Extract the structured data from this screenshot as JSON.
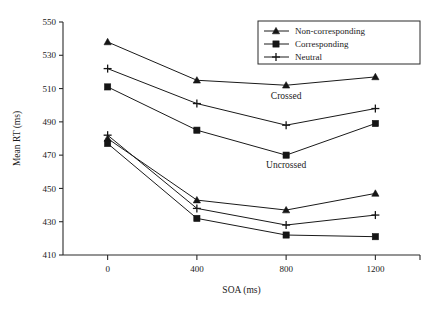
{
  "chart_data": {
    "type": "line",
    "title": "",
    "xlabel": "SOA (ms)",
    "ylabel": "Mean RT (ms)",
    "categories": [
      "0",
      "400",
      "800",
      "1200"
    ],
    "x": [
      0,
      400,
      800,
      1200
    ],
    "xlim": [
      -200,
      1400
    ],
    "ylim": [
      410,
      550
    ],
    "ytick_labels": [
      "410",
      "430",
      "450",
      "470",
      "490",
      "510",
      "530",
      "550"
    ],
    "yticks": [
      410,
      430,
      450,
      470,
      490,
      510,
      530,
      550
    ],
    "xtick_labels": [
      "0",
      "400",
      "800",
      "1200"
    ],
    "grid": false,
    "legend_position": "top-right",
    "series": [
      {
        "name": "Non-corresponding",
        "group": "Crossed",
        "marker": "triangle",
        "values": [
          538,
          515,
          512,
          517
        ]
      },
      {
        "name": "Neutral",
        "group": "Crossed",
        "marker": "plus",
        "values": [
          522,
          501,
          488,
          498
        ]
      },
      {
        "name": "Corresponding",
        "group": "Crossed",
        "marker": "square",
        "values": [
          511,
          485,
          470,
          489
        ]
      },
      {
        "name": "Non-corresponding",
        "group": "Uncrossed",
        "marker": "triangle",
        "values": [
          480,
          443,
          437,
          447
        ]
      },
      {
        "name": "Neutral",
        "group": "Uncrossed",
        "marker": "plus",
        "values": [
          482,
          438,
          428,
          434
        ]
      },
      {
        "name": "Corresponding",
        "group": "Uncrossed",
        "marker": "square",
        "values": [
          477,
          432,
          422,
          421
        ]
      }
    ],
    "annotations": [
      {
        "text": "Crossed",
        "x": 800,
        "y": 504
      },
      {
        "text": "Uncrossed",
        "x": 800,
        "y": 462
      }
    ],
    "legend_entries": [
      {
        "label": "Non-corresponding",
        "marker": "triangle"
      },
      {
        "label": "Corresponding",
        "marker": "square"
      },
      {
        "label": "Neutral",
        "marker": "plus"
      }
    ],
    "colors": {
      "line": "#1a1a1a",
      "marker": "#151515",
      "axis": "#2b2b2b",
      "background": "#ffffff"
    }
  }
}
